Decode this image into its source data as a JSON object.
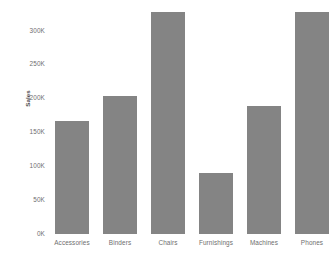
{
  "chart_data": {
    "type": "bar",
    "title": "",
    "subtitle": "",
    "xlabel": "",
    "ylabel": "Sales",
    "categories": [
      "Accessories",
      "Binders",
      "Chairs",
      "Furnishings",
      "Machines",
      "Phones"
    ],
    "values": [
      167000,
      203000,
      328000,
      90000,
      189000,
      327000
    ],
    "value_labels": [
      "167K",
      "203K",
      "328K",
      "90K",
      "189K",
      "327K"
    ],
    "series": [
      {
        "name": "Sales",
        "values": [
          167000,
          203000,
          328000,
          90000,
          189000,
          327000
        ]
      }
    ],
    "ylim": [
      0,
      345000
    ],
    "y_ticks": [
      0,
      50000,
      100000,
      150000,
      200000,
      250000,
      300000
    ],
    "y_tick_labels": [
      "0K",
      "50K",
      "100K",
      "150K",
      "200K",
      "250K",
      "300K"
    ],
    "grid": false,
    "legend": false,
    "legend_position": "none",
    "bar_color": "#848484",
    "text_color": "#6e6e6e",
    "axis_title_color": "#4a4a4a",
    "background_color": "#ffffff"
  }
}
